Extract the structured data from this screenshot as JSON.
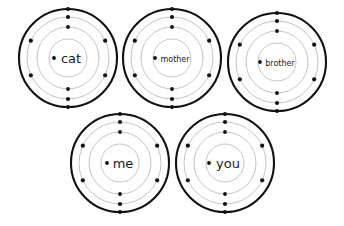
{
  "diagram": {
    "type": "atom-orbital-diagram",
    "title": "",
    "background_color": "#ffffff",
    "stroke_color": "#111111",
    "inner_stroke_color": "#b9b9b9",
    "label_color": "#1a1a1a",
    "atoms": [
      {
        "id": "atom-cat",
        "label": "cat",
        "label_font_size": 13,
        "cx": 68,
        "cy": 58,
        "radii": [
          19,
          31,
          41,
          49
        ],
        "nucleus_dot": {
          "dx": -14,
          "dy": 0,
          "r": 1.9
        },
        "electrons": [
          {
            "shell": 1,
            "angle": 270,
            "r": 1.9
          },
          {
            "shell": 1,
            "angle": 90,
            "r": 1.9
          },
          {
            "shell": 2,
            "angle": 270,
            "r": 2.1
          },
          {
            "shell": 2,
            "angle": 205,
            "r": 2.1
          },
          {
            "shell": 2,
            "angle": 335,
            "r": 2.1
          },
          {
            "shell": 2,
            "angle": 155,
            "r": 2.1
          },
          {
            "shell": 2,
            "angle": 25,
            "r": 2.1
          },
          {
            "shell": 2,
            "angle": 90,
            "r": 2.1
          },
          {
            "shell": 3,
            "angle": 270,
            "r": 2.1
          },
          {
            "shell": 3,
            "angle": 90,
            "r": 2.1
          }
        ]
      },
      {
        "id": "atom-mother",
        "label": "mother",
        "label_font_size": 8,
        "cx": 172,
        "cy": 58,
        "radii": [
          19,
          31,
          41,
          49
        ],
        "nucleus_dot": {
          "dx": -17,
          "dy": 0,
          "r": 1.9
        },
        "electrons": [
          {
            "shell": 1,
            "angle": 270,
            "r": 1.9
          },
          {
            "shell": 1,
            "angle": 90,
            "r": 1.9
          },
          {
            "shell": 2,
            "angle": 270,
            "r": 2.1
          },
          {
            "shell": 2,
            "angle": 205,
            "r": 2.1
          },
          {
            "shell": 2,
            "angle": 335,
            "r": 2.1
          },
          {
            "shell": 2,
            "angle": 155,
            "r": 2.1
          },
          {
            "shell": 2,
            "angle": 25,
            "r": 2.1
          },
          {
            "shell": 2,
            "angle": 90,
            "r": 2.1
          },
          {
            "shell": 3,
            "angle": 270,
            "r": 2.1
          },
          {
            "shell": 3,
            "angle": 90,
            "r": 2.1
          }
        ]
      },
      {
        "id": "atom-brother",
        "label": "brother",
        "label_font_size": 8,
        "cx": 277,
        "cy": 62,
        "radii": [
          19,
          31,
          41,
          49
        ],
        "nucleus_dot": {
          "dx": -17,
          "dy": 0,
          "r": 1.9
        },
        "electrons": [
          {
            "shell": 1,
            "angle": 270,
            "r": 1.9
          },
          {
            "shell": 1,
            "angle": 90,
            "r": 1.9
          },
          {
            "shell": 2,
            "angle": 270,
            "r": 2.1
          },
          {
            "shell": 2,
            "angle": 205,
            "r": 2.1
          },
          {
            "shell": 2,
            "angle": 335,
            "r": 2.1
          },
          {
            "shell": 2,
            "angle": 155,
            "r": 2.1
          },
          {
            "shell": 2,
            "angle": 25,
            "r": 2.1
          },
          {
            "shell": 2,
            "angle": 90,
            "r": 2.1
          },
          {
            "shell": 3,
            "angle": 270,
            "r": 2.1
          },
          {
            "shell": 3,
            "angle": 90,
            "r": 2.1
          }
        ]
      },
      {
        "id": "atom-me",
        "label": "me",
        "label_font_size": 13,
        "cx": 120,
        "cy": 163,
        "radii": [
          19,
          31,
          41,
          49
        ],
        "nucleus_dot": {
          "dx": -13,
          "dy": 0,
          "r": 1.9
        },
        "electrons": [
          {
            "shell": 1,
            "angle": 270,
            "r": 1.9
          },
          {
            "shell": 1,
            "angle": 90,
            "r": 1.9
          },
          {
            "shell": 2,
            "angle": 270,
            "r": 2.1
          },
          {
            "shell": 2,
            "angle": 205,
            "r": 2.1
          },
          {
            "shell": 2,
            "angle": 335,
            "r": 2.1
          },
          {
            "shell": 2,
            "angle": 155,
            "r": 2.1
          },
          {
            "shell": 2,
            "angle": 25,
            "r": 2.1
          },
          {
            "shell": 2,
            "angle": 90,
            "r": 2.1
          },
          {
            "shell": 3,
            "angle": 270,
            "r": 2.1
          },
          {
            "shell": 3,
            "angle": 90,
            "r": 2.1
          }
        ]
      },
      {
        "id": "atom-you",
        "label": "you",
        "label_font_size": 13,
        "cx": 225,
        "cy": 163,
        "radii": [
          19,
          31,
          41,
          49
        ],
        "nucleus_dot": {
          "dx": -16,
          "dy": 0,
          "r": 1.9
        },
        "electrons": [
          {
            "shell": 1,
            "angle": 270,
            "r": 1.9
          },
          {
            "shell": 1,
            "angle": 90,
            "r": 1.9
          },
          {
            "shell": 2,
            "angle": 270,
            "r": 2.1
          },
          {
            "shell": 2,
            "angle": 205,
            "r": 2.1
          },
          {
            "shell": 2,
            "angle": 335,
            "r": 2.1
          },
          {
            "shell": 2,
            "angle": 155,
            "r": 2.1
          },
          {
            "shell": 2,
            "angle": 25,
            "r": 2.1
          },
          {
            "shell": 2,
            "angle": 90,
            "r": 2.1
          },
          {
            "shell": 3,
            "angle": 270,
            "r": 2.1
          },
          {
            "shell": 3,
            "angle": 90,
            "r": 2.1
          }
        ]
      }
    ]
  }
}
